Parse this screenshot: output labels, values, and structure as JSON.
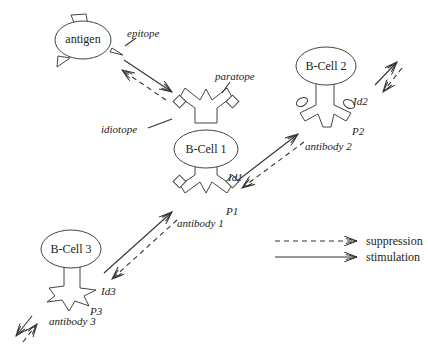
{
  "nodes": {
    "antigen": {
      "label": "antigen"
    },
    "bcell1": {
      "label": "B-Cell 1"
    },
    "bcell2": {
      "label": "B-Cell 2"
    },
    "bcell3": {
      "label": "B-Cell 3"
    }
  },
  "annotations": {
    "epitope": "epitope",
    "paratope": "paratope",
    "idiotope": "idiotope",
    "id1": "Id1",
    "p1": "P1",
    "antibody1": "antibody 1",
    "id2": "Id2",
    "p2": "P2",
    "antibody2": "antibody 2",
    "id3": "Id3",
    "p3": "P3",
    "antibody3": "antibody 3"
  },
  "legend": {
    "suppression": "suppression",
    "stimulation": "stimulation"
  },
  "edges": [
    {
      "from": "antigen",
      "to": "bcell1",
      "type": "stimulation"
    },
    {
      "from": "bcell1",
      "to": "antigen",
      "type": "suppression"
    },
    {
      "from": "bcell1",
      "to": "bcell2",
      "type": "stimulation"
    },
    {
      "from": "bcell2",
      "to": "bcell1",
      "type": "suppression"
    },
    {
      "from": "bcell3",
      "to": "bcell1",
      "type": "stimulation"
    },
    {
      "from": "bcell1",
      "to": "bcell3",
      "type": "suppression"
    }
  ]
}
